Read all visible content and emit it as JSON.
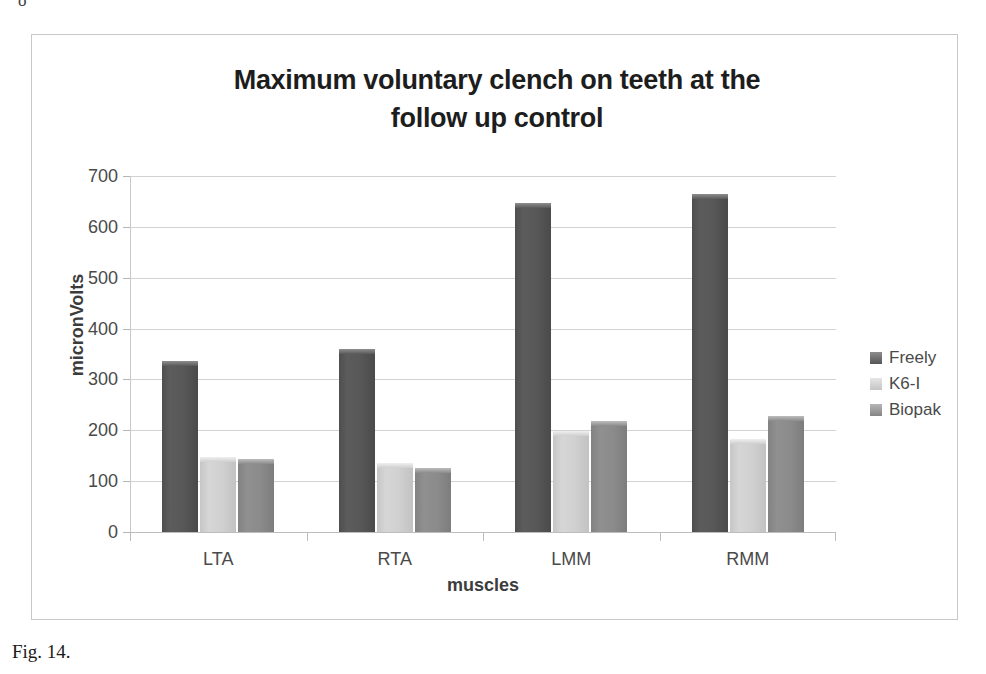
{
  "figure": {
    "caption": "Fig. 14.",
    "top_stray_glyph": "o"
  },
  "chart_data": {
    "type": "bar",
    "title": "Maximum voluntary clench on teeth at the follow up control",
    "title_line1": "Maximum voluntary clench on teeth at the",
    "title_line2": "follow up control",
    "xlabel": "muscles",
    "ylabel": "micronVolts",
    "categories": [
      "LTA",
      "RTA",
      "LMM",
      "RMM"
    ],
    "series": [
      {
        "name": "Freely",
        "color": "#555555",
        "values": [
          337,
          360,
          647,
          664
        ]
      },
      {
        "name": "K6-I",
        "color": "#cfcfcf",
        "values": [
          148,
          136,
          199,
          183
        ]
      },
      {
        "name": "Biopak",
        "color": "#888888",
        "values": [
          143,
          126,
          219,
          228
        ]
      }
    ],
    "ylim": [
      0,
      700
    ],
    "yticks": [
      0,
      100,
      200,
      300,
      400,
      500,
      600,
      700
    ],
    "ytick_labels": [
      "0",
      "100",
      "200",
      "300",
      "400",
      "500",
      "600",
      "700"
    ],
    "grid": true,
    "legend_position": "right"
  }
}
